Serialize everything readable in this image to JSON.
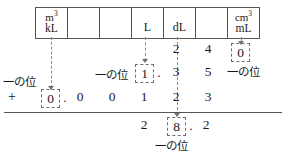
{
  "unit_table": {
    "name": "metric-volume-place-value-header",
    "cells": [
      {
        "top": "m",
        "top_sup": "3",
        "bottom": "kL"
      },
      {
        "top": "",
        "top_sup": "",
        "bottom": ""
      },
      {
        "top": "",
        "top_sup": "",
        "bottom": ""
      },
      {
        "top": "",
        "top_sup": "",
        "bottom": "L"
      },
      {
        "top": "",
        "top_sup": "",
        "bottom": "dL"
      },
      {
        "top": "",
        "top_sup": "",
        "bottom": ""
      },
      {
        "top": "cm",
        "top_sup": "3",
        "bottom": "mL"
      }
    ]
  },
  "rows": {
    "row1": {
      "digits": [
        "2",
        "4"
      ]
    },
    "row2": {
      "boxed_digit": "1",
      "decimal_point": ".",
      "digits": [
        "3",
        "5"
      ],
      "label": "一の位"
    },
    "row3": {
      "operator": "+",
      "boxed_digit": "0",
      "decimal_point": ".",
      "digits": [
        "0",
        "0",
        "1",
        "2",
        "3"
      ],
      "label": "一の位"
    },
    "row4": {
      "digit_left": "2",
      "boxed_digit": "8",
      "decimal_point": ".",
      "digit_right": "2",
      "label": "一の位"
    }
  },
  "callouts": {
    "ml_boxed_digit": "0",
    "ml_label": "一の位"
  },
  "colors": {
    "ink": "#1a1a1a",
    "rule": "#55565a",
    "dashed": "#6e6f73"
  }
}
